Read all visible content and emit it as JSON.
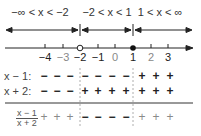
{
  "intervals": [
    {
      "label": "−∞ < x < −2",
      "center_x": 40
    },
    {
      "label": "−2 < x < 1",
      "center_x": 107
    },
    {
      "label": "1 < x < ∞",
      "center_x": 160
    }
  ],
  "number_line": {
    "ticks": [
      {
        "value": "−4",
        "x": 45,
        "dim": false
      },
      {
        "value": "−3",
        "x": 63,
        "dim": true
      },
      {
        "value": "−2",
        "x": 80,
        "dim": false
      },
      {
        "value": "−1",
        "x": 98,
        "dim": false
      },
      {
        "value": "0",
        "x": 115,
        "dim": true
      },
      {
        "value": "1",
        "x": 133,
        "dim": false
      },
      {
        "value": "2",
        "x": 151,
        "dim": true
      },
      {
        "value": "3",
        "x": 168,
        "dim": false
      }
    ],
    "open_point": "−2",
    "closed_point": "1"
  },
  "rows": [
    {
      "label": "x − 1:",
      "signs": [
        "−",
        "−",
        "−",
        "−",
        "−",
        "−",
        "−",
        "+",
        "+",
        "+"
      ]
    },
    {
      "label": "x + 2:",
      "signs": [
        "−",
        "−",
        "−",
        "+",
        "+",
        "+",
        "+",
        "+",
        "+",
        "+"
      ]
    }
  ],
  "result_row": {
    "numerator": "x − 1",
    "denominator": "x + 2",
    "signs": [
      "+",
      "+",
      "+",
      "−",
      "−",
      "−",
      "−",
      "+",
      "+",
      "+"
    ]
  },
  "colors": {
    "line": "#222222",
    "dim_text": "#888888",
    "dash": "#999999"
  }
}
